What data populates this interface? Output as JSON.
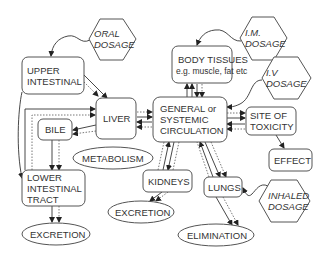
{
  "diagram": {
    "nodes": {
      "oral_dosage": [
        "ORAL",
        "DOSAGE"
      ],
      "upper_intestinal": [
        "UPPER",
        "INTESTINAL"
      ],
      "liver": [
        "LIVER"
      ],
      "bile": [
        "BILE"
      ],
      "metabolism": [
        "METABOLISM"
      ],
      "lower_intestinal": [
        "LOWER",
        "INTESTINAL",
        "TRACT"
      ],
      "excretion_left": [
        "EXCRETION"
      ],
      "body_tissues": [
        "BODY TISSUES",
        "e.g. muscle, fat etc"
      ],
      "im_dosage": [
        "I.M.",
        "DOSAGE"
      ],
      "iv_dosage": [
        "I.V",
        "DOSAGE"
      ],
      "circulation": [
        "GENERAL or",
        "SYSTEMIC",
        "CIRCULATION"
      ],
      "site_of_toxicity": [
        "SITE OF",
        "TOXICITY"
      ],
      "effect": [
        "EFFECT"
      ],
      "kidneys": [
        "KIDNEYS"
      ],
      "excretion_mid": [
        "EXCRETION"
      ],
      "lungs": [
        "LUNGS"
      ],
      "inhaled_dosage": [
        "INHALED",
        "DOSAGE"
      ],
      "elimination": [
        "ELIMINATION"
      ]
    },
    "edges": [
      {
        "from": "oral_dosage",
        "to": "upper_intestinal"
      },
      {
        "from": "upper_intestinal",
        "to": "liver"
      },
      {
        "from": "upper_intestinal",
        "to": "lower_intestinal"
      },
      {
        "from": "lower_intestinal",
        "to": "liver"
      },
      {
        "from": "liver",
        "to": "bile"
      },
      {
        "from": "bile",
        "to": "lower_intestinal"
      },
      {
        "from": "liver",
        "to": "circulation",
        "bidirectional": true
      },
      {
        "from": "lower_intestinal",
        "to": "excretion_left"
      },
      {
        "from": "im_dosage",
        "to": "body_tissues"
      },
      {
        "from": "body_tissues",
        "to": "circulation",
        "bidirectional": true
      },
      {
        "from": "iv_dosage",
        "to": "circulation"
      },
      {
        "from": "circulation",
        "to": "site_of_toxicity",
        "bidirectional": true
      },
      {
        "from": "site_of_toxicity",
        "to": "effect"
      },
      {
        "from": "circulation",
        "to": "kidneys",
        "bidirectional": true
      },
      {
        "from": "kidneys",
        "to": "excretion_mid"
      },
      {
        "from": "circulation",
        "to": "lungs",
        "bidirectional": true
      },
      {
        "from": "inhaled_dosage",
        "to": "lungs"
      },
      {
        "from": "lungs",
        "to": "elimination"
      }
    ]
  }
}
